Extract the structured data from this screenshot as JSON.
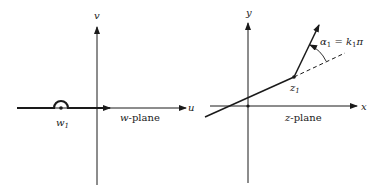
{
  "w_plane": {
    "axis_u_label": "u",
    "axis_v_label": "v",
    "point_label": "w",
    "point_sub": "1",
    "plane_label_var": "w",
    "plane_label_rest": "-plane"
  },
  "z_plane": {
    "axis_x_label": "x",
    "axis_y_label": "y",
    "point_label": "z",
    "point_sub": "1",
    "angle_label_alpha": "α",
    "angle_label_alpha_sub": "1",
    "angle_label_eq": " = ",
    "angle_label_k": "k",
    "angle_label_k_sub": "1",
    "angle_label_pi": "π",
    "plane_label_var": "z",
    "plane_label_rest": "-plane"
  },
  "colors": {
    "ink": "#1a1a1a",
    "background": "#ffffff"
  }
}
